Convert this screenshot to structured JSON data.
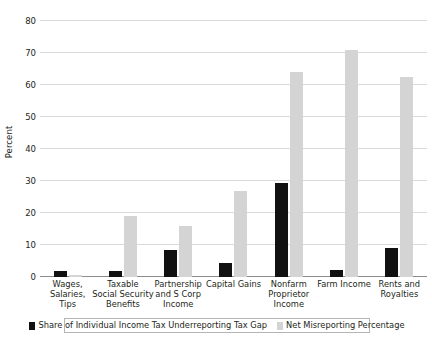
{
  "chart_data": {
    "type": "bar",
    "title": "",
    "xlabel": "",
    "ylabel": "Percent",
    "ylim": [
      0,
      80
    ],
    "yticks": [
      0,
      10,
      20,
      30,
      40,
      50,
      60,
      70,
      80
    ],
    "grid": true,
    "legend_position": "bottom",
    "categories": [
      "Wages, Salaries, Tips",
      "Taxable Social Security Benefits",
      "Partnership and S Corp Income",
      "Capital Gains",
      "Nonfarm Proprietor Income",
      "Farm Income",
      "Rents and Royalties"
    ],
    "category_lines": [
      [
        "Wages, Salaries,",
        "Tips"
      ],
      [
        "Taxable",
        "Social Security",
        "Benefits"
      ],
      [
        "Partnership",
        "and S Corp",
        "Income"
      ],
      [
        "Capital Gains"
      ],
      [
        "Nonfarm",
        "Proprietor",
        "Income"
      ],
      [
        "Farm Income"
      ],
      [
        "Rents and",
        "Royalties"
      ]
    ],
    "series": [
      {
        "name": "Share of Individual Income Tax Underreporting Tax Gap",
        "color": "#111111",
        "values": [
          2.0,
          2.0,
          8.5,
          4.5,
          29.5,
          2.2,
          9.0
        ]
      },
      {
        "name": "Net Misreporting Percentage",
        "color": "#d4d4d4",
        "values": [
          0.5,
          19.0,
          15.8,
          27.0,
          64.0,
          71.0,
          62.5
        ]
      }
    ]
  },
  "legend": {
    "items": [
      {
        "label": "Share of Individual Income Tax Underreporting Tax Gap",
        "color": "#111111"
      },
      {
        "label": "Net Misreporting Percentage",
        "color": "#d4d4d4"
      }
    ]
  }
}
